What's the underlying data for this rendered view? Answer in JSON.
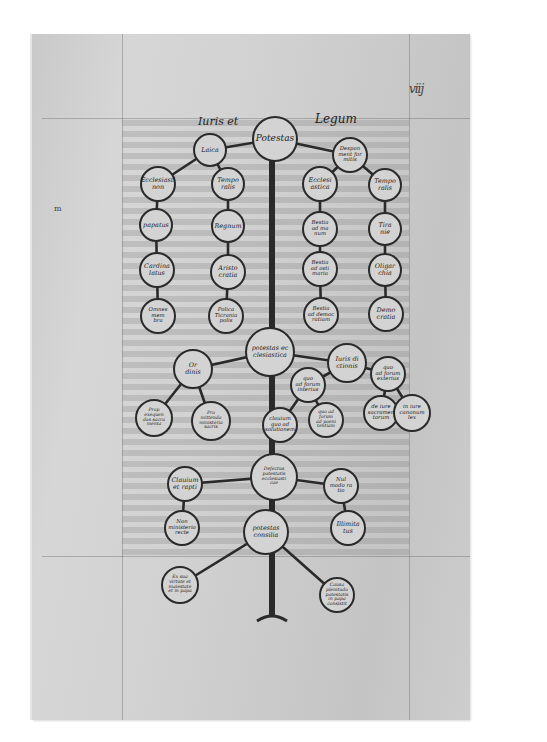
{
  "manuscript": {
    "folio_number": "viij",
    "margin_mark": "m",
    "heading_left": "Iuris et",
    "heading_right": "Legum",
    "colors": {
      "parchment": "#d0d0d0",
      "ink": "#1d1d1d",
      "circle_stroke": "#2a2a2a",
      "trunk": "#2a2a2a"
    }
  },
  "tree": {
    "root": {
      "id": "potestas",
      "label": "Potestas",
      "x": 275,
      "y": 139,
      "r": 22
    },
    "nodes": [
      {
        "id": "laica",
        "label": "Laica",
        "x": 210,
        "y": 150,
        "r": 16
      },
      {
        "id": "desponsamentum",
        "label": "Despon\nment for\nmitis",
        "x": 350,
        "y": 155,
        "r": 17
      },
      {
        "id": "ecclesiastica-left",
        "label": "Ecclesiasti\nnon",
        "x": 158,
        "y": 184,
        "r": 17
      },
      {
        "id": "temporalis-left",
        "label": "Tempo\nralis",
        "x": 228,
        "y": 184,
        "r": 16
      },
      {
        "id": "ecclesiastica-right",
        "label": "Ecclesi\nastica",
        "x": 320,
        "y": 184,
        "r": 17
      },
      {
        "id": "temporalis-right",
        "label": "Tempo\nralis",
        "x": 385,
        "y": 185,
        "r": 16
      },
      {
        "id": "papatus",
        "label": "papatus",
        "x": 156,
        "y": 225,
        "r": 16
      },
      {
        "id": "regnum",
        "label": "Regnum",
        "x": 228,
        "y": 226,
        "r": 16
      },
      {
        "id": "bestialiter",
        "label": "Bestia\nad ma\nnum",
        "x": 320,
        "y": 229,
        "r": 17
      },
      {
        "id": "tiranie",
        "label": "Tira\nnie",
        "x": 385,
        "y": 229,
        "r": 16
      },
      {
        "id": "cardinalatus",
        "label": "Cardina\nlatus",
        "x": 157,
        "y": 270,
        "r": 17
      },
      {
        "id": "aristocratia",
        "label": "Aristo\ncratia",
        "x": 228,
        "y": 272,
        "r": 17
      },
      {
        "id": "bestia-mariana",
        "label": "Bestia\nad osti\nmaria",
        "x": 320,
        "y": 269,
        "r": 17
      },
      {
        "id": "oligarchia",
        "label": "Oligar\nchia",
        "x": 385,
        "y": 270,
        "r": 16
      },
      {
        "id": "omnes-ecclesie",
        "label": "Omnes\nmem\nbra",
        "x": 158,
        "y": 316,
        "r": 17
      },
      {
        "id": "policraticia",
        "label": "Polica\nTicrania\npolis",
        "x": 226,
        "y": 316,
        "r": 17
      },
      {
        "id": "bestia-democratia",
        "label": "Bestia\nad democ\nratiam",
        "x": 321,
        "y": 315,
        "r": 17
      },
      {
        "id": "democratia",
        "label": "Demo\ncratia",
        "x": 386,
        "y": 314,
        "r": 17
      },
      {
        "id": "potestas-ecclesiastica",
        "label": "potestas ec\nclesiastica",
        "x": 270,
        "y": 352,
        "r": 24
      },
      {
        "id": "ordinis",
        "label": "Or\ndinis",
        "x": 193,
        "y": 369,
        "r": 19
      },
      {
        "id": "iurisdictionis",
        "label": "Iuris di\nctionis",
        "x": 347,
        "y": 363,
        "r": 19
      },
      {
        "id": "quo-ad-forum-interius",
        "label": "quo\nad forum\ninterius",
        "x": 308,
        "y": 385,
        "r": 17
      },
      {
        "id": "quo-ad-forum-exterius",
        "label": "quo\nad forum\nexterius",
        "x": 388,
        "y": 374,
        "r": 17
      },
      {
        "id": "ordinis-left-sub",
        "label": "Prop\nexequen\ndos sacra\nmenta",
        "x": 154,
        "y": 418,
        "r": 18
      },
      {
        "id": "ordinis-right-sub",
        "label": "Pro\nmittenda\nministeria\nsacris",
        "x": 211,
        "y": 421,
        "r": 19
      },
      {
        "id": "interius-sub",
        "label": "clauium\nquo ad\nsolutionem",
        "x": 280,
        "y": 425,
        "r": 17
      },
      {
        "id": "interius-right-sub",
        "label": "quo ad\nforum\nad poeni\ntentiam",
        "x": 326,
        "y": 420,
        "r": 17
      },
      {
        "id": "exterius-sub1",
        "label": "de iure\nsacramen\ntorum",
        "x": 381,
        "y": 413,
        "r": 17
      },
      {
        "id": "exterius-sub2",
        "label": "in iure\ncanonum\nlex",
        "x": 412,
        "y": 413,
        "r": 18
      },
      {
        "id": "defectus-potestatis",
        "label": "Defectus\npotestatis\necclesiasti\ncae",
        "x": 274,
        "y": 477,
        "r": 23
      },
      {
        "id": "clauium-et-rapti",
        "label": "Clauium\net rapti",
        "x": 185,
        "y": 484,
        "r": 17
      },
      {
        "id": "nullo-modo",
        "label": "Nul\nmodo ra\ntio",
        "x": 341,
        "y": 486,
        "r": 17
      },
      {
        "id": "non-ministerio",
        "label": "Non\nministerio\nrecte",
        "x": 182,
        "y": 528,
        "r": 17
      },
      {
        "id": "plenitudo",
        "label": "Plenitu\ndo",
        "x": 266,
        "y": 532,
        "r": 22
      },
      {
        "id": "plenitudo-text",
        "label": "potestas\nconsilia",
        "x": 266,
        "y": 532,
        "r": 0
      },
      {
        "id": "illimitatus",
        "label": "Illimita\ntus",
        "x": 348,
        "y": 528,
        "r": 17
      },
      {
        "id": "causa-left",
        "label": "Ex sua\nvirtute et\nmaiestate\net in papa",
        "x": 180,
        "y": 585,
        "r": 18
      },
      {
        "id": "causa-right",
        "label": "Causa\nplenitudo\npotestatis\nin papa\nconsistit",
        "x": 337,
        "y": 595,
        "r": 17
      }
    ],
    "edges": [
      [
        "potestas",
        "laica"
      ],
      [
        "potestas",
        "desponsamentum"
      ],
      [
        "laica",
        "ecclesiastica-left"
      ],
      [
        "laica",
        "temporalis-left"
      ],
      [
        "desponsamentum",
        "ecclesiastica-right"
      ],
      [
        "desponsamentum",
        "temporalis-right"
      ],
      [
        "ecclesiastica-left",
        "papatus"
      ],
      [
        "papatus",
        "cardinalatus"
      ],
      [
        "cardinalatus",
        "omnes-ecclesie"
      ],
      [
        "temporalis-left",
        "regnum"
      ],
      [
        "regnum",
        "aristocratia"
      ],
      [
        "aristocratia",
        "policraticia"
      ],
      [
        "ecclesiastica-right",
        "bestialiter"
      ],
      [
        "bestialiter",
        "bestia-mariana"
      ],
      [
        "bestia-mariana",
        "bestia-democratia"
      ],
      [
        "temporalis-right",
        "tiranie"
      ],
      [
        "tiranie",
        "oligarchia"
      ],
      [
        "oligarchia",
        "democratia"
      ],
      [
        "potestas-ecclesiastica",
        "ordinis"
      ],
      [
        "potestas-ecclesiastica",
        "iurisdictionis"
      ],
      [
        "iurisdictionis",
        "quo-ad-forum-interius"
      ],
      [
        "iurisdictionis",
        "quo-ad-forum-exterius"
      ],
      [
        "ordinis",
        "ordinis-left-sub"
      ],
      [
        "ordinis",
        "ordinis-right-sub"
      ],
      [
        "quo-ad-forum-interius",
        "interius-sub"
      ],
      [
        "quo-ad-forum-interius",
        "interius-right-sub"
      ],
      [
        "quo-ad-forum-exterius",
        "exterius-sub1"
      ],
      [
        "quo-ad-forum-exterius",
        "exterius-sub2"
      ],
      [
        "defectus-potestatis",
        "clauium-et-rapti"
      ],
      [
        "defectus-potestatis",
        "nullo-modo"
      ],
      [
        "clauium-et-rapti",
        "non-ministerio"
      ],
      [
        "nullo-modo",
        "illimitatus"
      ],
      [
        "plenitudo",
        "causa-left"
      ],
      [
        "plenitudo",
        "causa-right"
      ]
    ],
    "trunk": {
      "x": 272,
      "top": 161,
      "bottom": 615,
      "base_width": 30
    }
  }
}
